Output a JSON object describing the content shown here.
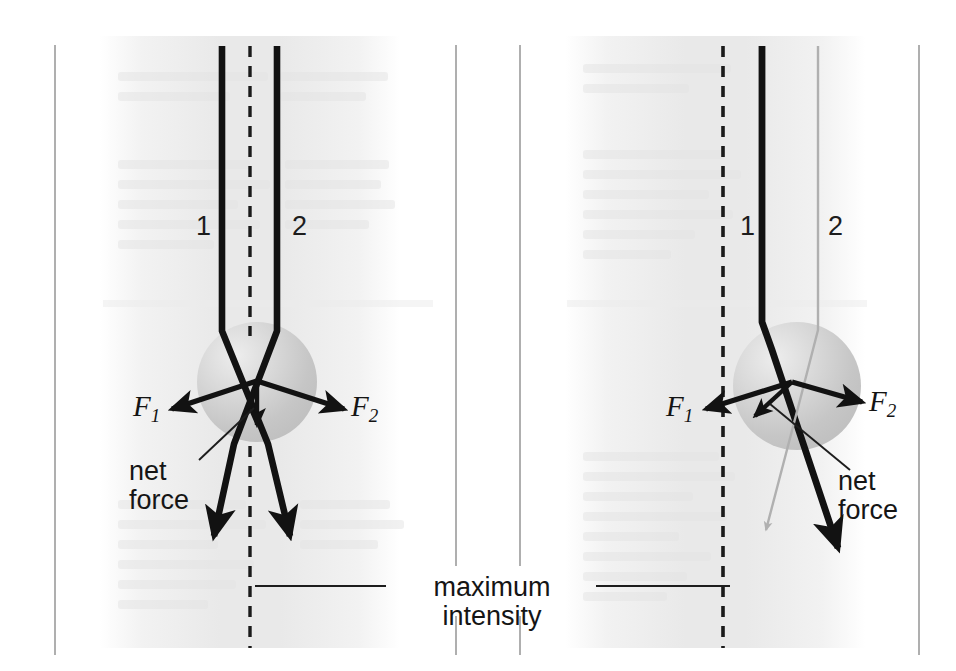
{
  "figure": {
    "type": "physics-diagram",
    "panels": [
      {
        "id": "left-panel",
        "name": "bead-centered-on-beam-axis",
        "beam_labels": [
          "1",
          "2"
        ],
        "force_labels": [
          "F",
          "F"
        ],
        "force_subscripts": [
          "1",
          "2"
        ],
        "net_force_label": "net\nforce",
        "net_force_line1": "net",
        "net_force_line2": "force",
        "net_force_direction": "straight-down",
        "bead_center_x": 257,
        "bead_center_y": 382,
        "bead_radius": 60,
        "axis_x": 250
      },
      {
        "id": "right-panel",
        "name": "bead-offset-from-beam-axis",
        "beam_labels": [
          "1",
          "2"
        ],
        "force_labels": [
          "F",
          "F"
        ],
        "force_subscripts": [
          "1",
          "2"
        ],
        "net_force_label": "net\nforce",
        "net_force_line1": "net",
        "net_force_line2": "force",
        "net_force_direction": "down-left-toward-axis",
        "bead_center_x": 797,
        "bead_center_y": 386,
        "bead_radius": 64,
        "axis_x": 723
      }
    ],
    "annotation": {
      "max_intensity_line1": "maximum",
      "max_intensity_line2": "intensity"
    },
    "colors": {
      "ink": "#161616",
      "beam_strong": "#111111",
      "beam_weak": "#a9a9a9",
      "bead_fill": "#c9c9c9",
      "bead_highlight": "#e2e2e2",
      "rule": "#8d8d8d",
      "page": "#ffffff",
      "bleed_text": "#e9e9e9"
    },
    "column_rules_x": [
      55,
      456,
      520,
      919
    ],
    "column_rule_top": 45,
    "column_rule_bottom": 655
  }
}
